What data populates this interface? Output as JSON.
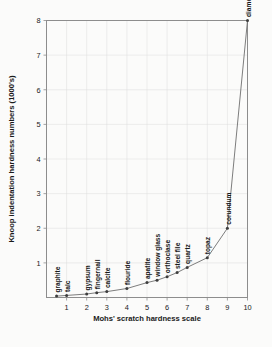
{
  "chart_data": {
    "type": "line",
    "title": "",
    "xlabel": "Mohs' scratch hardness scale",
    "ylabel": "Knoop indentation hardness numbers (1000's)",
    "xlim": [
      0,
      10
    ],
    "ylim": [
      0,
      8
    ],
    "xticks": [
      1,
      2,
      3,
      4,
      5,
      6,
      7,
      8,
      9,
      10
    ],
    "yticks": [
      1,
      2,
      3,
      4,
      5,
      6,
      7,
      8
    ],
    "grid": true,
    "legend": "none",
    "x": [
      0.5,
      1,
      2,
      2.5,
      3,
      4,
      5,
      5.5,
      6,
      6.5,
      7,
      8,
      9,
      10
    ],
    "y": [
      0.04,
      0.06,
      0.1,
      0.14,
      0.17,
      0.26,
      0.43,
      0.5,
      0.6,
      0.72,
      0.87,
      1.15,
      2.0,
      8.0
    ],
    "point_labels": [
      "graphite",
      "talc",
      "gypsum",
      "fingernail",
      "calcite",
      "flouride",
      "apatite",
      "window glass",
      "orthoclase",
      "steel file",
      "quartz",
      "topaz",
      "corundum",
      "diamond"
    ],
    "colors": {
      "line": "#6e6e6e",
      "marker": "#3d3d3d",
      "grid": "#dcdcdc",
      "frame": "#8d8d8d",
      "background": "#fbfbfa",
      "text": "#1a1a1a"
    }
  }
}
